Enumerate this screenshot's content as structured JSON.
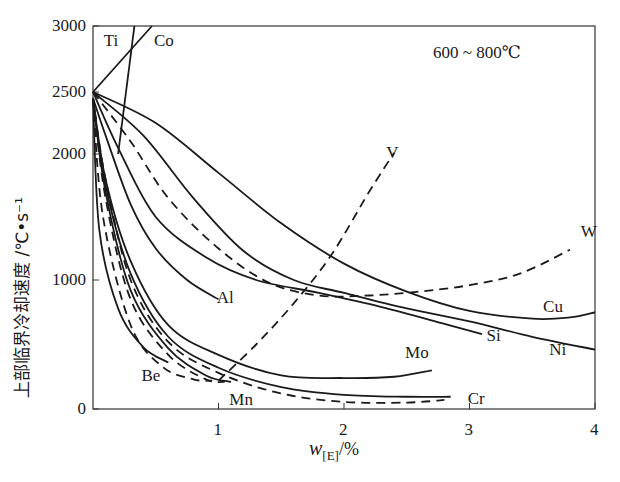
{
  "chart_data": {
    "type": "line",
    "title": "",
    "annotation": "600 ~ 800℃",
    "xlabel": "w[E]/%",
    "xlabel_main": "w",
    "xlabel_sub": "[E]",
    "xlabel_unit": "/%",
    "ylabel": "上部临界冷却速度 /℃•s⁻¹",
    "xlim": [
      0,
      4
    ],
    "ylim": [
      0,
      3000
    ],
    "y_scale_note": "non-linear (broken) y axis",
    "x_ticks": [
      "1",
      "2",
      "3",
      "4"
    ],
    "y_ticks": [
      "0",
      "1000",
      "2000",
      "2500",
      "3000"
    ],
    "grid": false,
    "legend": "none (curves labeled inline)",
    "series": [
      {
        "name": "Ti",
        "style": "solid",
        "points": [
          [
            0.2,
            2000
          ],
          [
            0.33,
            3000
          ]
        ]
      },
      {
        "name": "Co",
        "style": "solid",
        "points": [
          [
            0,
            2500
          ],
          [
            0.47,
            3000
          ]
        ]
      },
      {
        "name": "Cu",
        "style": "solid",
        "points": [
          [
            0,
            2500
          ],
          [
            0.5,
            2250
          ],
          [
            1.0,
            1850
          ],
          [
            1.5,
            1450
          ],
          [
            2.0,
            1130
          ],
          [
            2.5,
            910
          ],
          [
            3.0,
            760
          ],
          [
            3.5,
            700
          ],
          [
            3.8,
            710
          ],
          [
            4.0,
            750
          ]
        ]
      },
      {
        "name": "Ni",
        "style": "solid",
        "points": [
          [
            0,
            2500
          ],
          [
            0.4,
            2150
          ],
          [
            0.8,
            1650
          ],
          [
            1.2,
            1230
          ],
          [
            1.6,
            1000
          ],
          [
            2.0,
            900
          ],
          [
            2.5,
            780
          ],
          [
            3.0,
            680
          ],
          [
            3.5,
            560
          ],
          [
            4.0,
            460
          ]
        ]
      },
      {
        "name": "W",
        "style": "dashed",
        "points": [
          [
            0,
            2500
          ],
          [
            0.3,
            2100
          ],
          [
            0.6,
            1650
          ],
          [
            1.0,
            1250
          ],
          [
            1.4,
            980
          ],
          [
            1.8,
            880
          ],
          [
            2.2,
            880
          ],
          [
            2.6,
            910
          ],
          [
            3.0,
            960
          ],
          [
            3.4,
            1050
          ],
          [
            3.8,
            1240
          ]
        ]
      },
      {
        "name": "Si",
        "style": "solid",
        "points": [
          [
            0,
            2500
          ],
          [
            0.2,
            2050
          ],
          [
            0.5,
            1500
          ],
          [
            0.9,
            1180
          ],
          [
            1.3,
            1000
          ],
          [
            1.8,
            900
          ],
          [
            2.3,
            790
          ],
          [
            2.8,
            660
          ],
          [
            3.1,
            580
          ]
        ]
      },
      {
        "name": "V",
        "style": "dashed",
        "points": [
          [
            1.0,
            220
          ],
          [
            1.3,
            500
          ],
          [
            1.6,
            820
          ],
          [
            1.9,
            1200
          ],
          [
            2.2,
            1700
          ],
          [
            2.4,
            2010
          ]
        ]
      },
      {
        "name": "Al",
        "style": "solid",
        "points": [
          [
            0,
            2450
          ],
          [
            0.1,
            2150
          ],
          [
            0.3,
            1600
          ],
          [
            0.5,
            1250
          ],
          [
            0.75,
            1000
          ],
          [
            1.0,
            850
          ]
        ]
      },
      {
        "name": "Mo",
        "style": "solid",
        "points": [
          [
            0,
            2450
          ],
          [
            0.1,
            1800
          ],
          [
            0.3,
            1150
          ],
          [
            0.6,
            650
          ],
          [
            1.0,
            420
          ],
          [
            1.5,
            260
          ],
          [
            2.0,
            240
          ],
          [
            2.4,
            250
          ],
          [
            2.7,
            300
          ]
        ]
      },
      {
        "name": "Cr",
        "style": "solid",
        "points": [
          [
            0,
            2450
          ],
          [
            0.1,
            1750
          ],
          [
            0.3,
            1050
          ],
          [
            0.6,
            560
          ],
          [
            1.0,
            320
          ],
          [
            1.5,
            170
          ],
          [
            2.0,
            110
          ],
          [
            2.5,
            95
          ],
          [
            2.85,
            95
          ]
        ]
      },
      {
        "name": "Mn",
        "style": "dashed",
        "points": [
          [
            0,
            2450
          ],
          [
            0.1,
            1800
          ],
          [
            0.3,
            1000
          ],
          [
            0.6,
            520
          ],
          [
            1.0,
            280
          ],
          [
            1.5,
            120
          ],
          [
            2.0,
            55
          ],
          [
            2.5,
            50
          ],
          [
            2.8,
            70
          ]
        ]
      },
      {
        "name": "Be-inner",
        "style": "dashed",
        "points": [
          [
            0,
            2450
          ],
          [
            0.1,
            1650
          ],
          [
            0.3,
            850
          ],
          [
            0.6,
            420
          ],
          [
            0.9,
            230
          ],
          [
            1.05,
            210
          ]
        ]
      },
      {
        "name": "Be-mid",
        "style": "dashed",
        "points": [
          [
            0,
            2450
          ],
          [
            0.08,
            1500
          ],
          [
            0.3,
            650
          ],
          [
            0.55,
            330
          ],
          [
            0.8,
            230
          ],
          [
            0.95,
            220
          ]
        ]
      },
      {
        "name": "Be-solid2",
        "style": "solid",
        "points": [
          [
            0,
            2450
          ],
          [
            0.1,
            1700
          ],
          [
            0.3,
            920
          ],
          [
            0.6,
            470
          ],
          [
            0.9,
            260
          ],
          [
            1.1,
            210
          ]
        ]
      },
      {
        "name": "Be",
        "style": "solid",
        "points": [
          [
            0,
            2450
          ],
          [
            0.05,
            1400
          ],
          [
            0.2,
            780
          ],
          [
            0.4,
            480
          ],
          [
            0.6,
            360
          ]
        ]
      }
    ],
    "curve_labels": [
      {
        "text": "Ti",
        "x": 0.15,
        "y": 2880
      },
      {
        "text": "Co",
        "x": 0.55,
        "y": 2880
      },
      {
        "text": "V",
        "x": 2.4,
        "y": 2000
      },
      {
        "text": "W",
        "x": 3.95,
        "y": 1370
      },
      {
        "text": "Al",
        "x": 1.05,
        "y": 850
      },
      {
        "text": "Cu",
        "x": 3.65,
        "y": 780
      },
      {
        "text": "Si",
        "x": 3.2,
        "y": 560
      },
      {
        "text": "Ni",
        "x": 3.7,
        "y": 450
      },
      {
        "text": "Mo",
        "x": 2.55,
        "y": 430
      },
      {
        "text": "Be",
        "x": 0.45,
        "y": 250
      },
      {
        "text": "Mn",
        "x": 1.15,
        "y": 60
      },
      {
        "text": "Cr",
        "x": 3.05,
        "y": 70
      }
    ]
  }
}
